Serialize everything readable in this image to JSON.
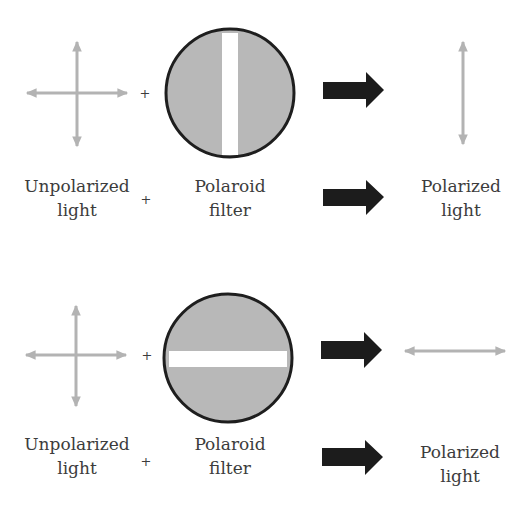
{
  "colors": {
    "light_ray": "#b3b3b3",
    "filter_fill": "#b8b8b8",
    "filter_border": "#1e1e1e",
    "filter_slot": "#ffffff",
    "arrow": "#1c1c1c",
    "text": "#3c3c3c"
  },
  "rows": [
    {
      "id": "vertical-filter",
      "input_label": [
        "Unpolarized",
        "light"
      ],
      "operator": "+",
      "filter_label": [
        "Polaroid",
        "filter"
      ],
      "filter_slot_orientation": "vertical",
      "output_label": [
        "Polarized",
        "light"
      ],
      "output_ray_orientation": "vertical"
    },
    {
      "id": "horizontal-filter",
      "input_label": [
        "Unpolarized",
        "light"
      ],
      "operator": "+",
      "filter_label": [
        "Polaroid",
        "filter"
      ],
      "filter_slot_orientation": "horizontal",
      "output_label": [
        "Polarized",
        "light"
      ],
      "output_ray_orientation": "horizontal"
    }
  ]
}
